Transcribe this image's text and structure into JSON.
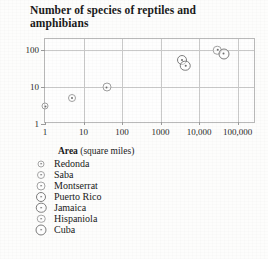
{
  "title": "Number of species of reptiles and amphibians",
  "axis_caption": {
    "bold": "Area",
    "rest": " (square miles)"
  },
  "footnote": "",
  "legend": {
    "items": [
      {
        "label": "Redonda",
        "size": 7
      },
      {
        "label": "Saba",
        "size": 8
      },
      {
        "label": "Montserrat",
        "size": 9
      },
      {
        "label": "Puerto Rico",
        "size": 10
      },
      {
        "label": "Jamaica",
        "size": 10.5
      },
      {
        "label": "Hispaniola",
        "size": 8.5
      },
      {
        "label": "Cuba",
        "size": 11
      }
    ]
  },
  "chart_data": {
    "type": "scatter",
    "title": "Number of species of reptiles and amphibians",
    "xlabel": "Area (square miles)",
    "ylabel": "Number of species of reptiles and amphibians",
    "xscale": "log",
    "yscale": "log",
    "xlim": [
      1,
      300000
    ],
    "ylim": [
      1,
      200
    ],
    "grid": true,
    "legend_position": "below",
    "xticks": [
      "1",
      "10",
      "100",
      "1000",
      "10,000",
      "100,000"
    ],
    "xtick_values": [
      1,
      10,
      100,
      1000,
      10000,
      100000
    ],
    "yticks": [
      "1",
      "10",
      "100"
    ],
    "ytick_values": [
      1,
      10,
      100
    ],
    "points": [
      {
        "name": "Redonda",
        "x": 1,
        "y": 3,
        "marker_size": 7
      },
      {
        "name": "Saba",
        "x": 5,
        "y": 5,
        "marker_size": 8
      },
      {
        "name": "Montserrat",
        "x": 40,
        "y": 10,
        "marker_size": 9
      },
      {
        "name": "Puerto Rico",
        "x": 3500,
        "y": 55,
        "marker_size": 10
      },
      {
        "name": "Jamaica",
        "x": 4400,
        "y": 38,
        "marker_size": 10.5
      },
      {
        "name": "Hispaniola",
        "x": 30000,
        "y": 100,
        "marker_size": 8.5
      },
      {
        "name": "Cuba",
        "x": 44000,
        "y": 80,
        "marker_size": 11
      }
    ]
  }
}
